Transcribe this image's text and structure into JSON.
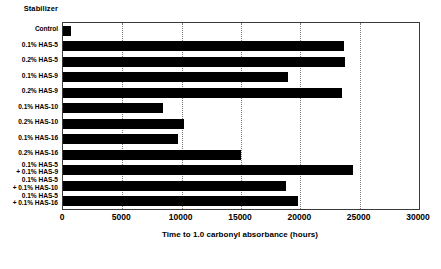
{
  "chart_data": {
    "type": "bar",
    "orientation": "horizontal",
    "title": "",
    "ylabel": "Stabilizer",
    "xlabel": "Time to 1.0 carbonyl absorbance (hours)",
    "xlim": [
      0,
      30000
    ],
    "xticks": [
      0,
      5000,
      10000,
      15000,
      20000,
      25000,
      30000
    ],
    "xtick_labels": [
      "0",
      "5000",
      "10000",
      "15000",
      "20000",
      "25000",
      "30000"
    ],
    "grid": "vertical-dotted",
    "legend": "none",
    "bar_color": "#000000",
    "categories": [
      "Control",
      "0.1% HAS-5",
      "0.2% HAS-5",
      "0.1% HAS-9",
      "0.2% HAS-9",
      "0.1% HAS-10",
      "0.2% HAS-10",
      "0.1% HAS-16",
      "0.2% HAS-16",
      "0.1% HAS-5\n+ 0.1% HAS-9",
      "0.1% HAS-5\n+ 0.1% HAS-10",
      "0.1% HAS-5\n+ 0.1% HAS-16"
    ],
    "values": [
      700,
      23700,
      23800,
      19000,
      23500,
      8400,
      10200,
      9700,
      15000,
      24400,
      18800,
      19800
    ]
  }
}
